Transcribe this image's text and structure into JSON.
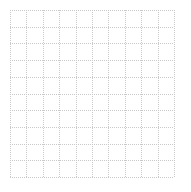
{
  "canvas": {
    "width": 191,
    "height": 192,
    "background_color": "#ffffff"
  },
  "chart_data": {
    "type": "table",
    "title": "",
    "subtitle": "",
    "xlabel": "",
    "ylabel": "",
    "grid": true,
    "legend_position": "none",
    "categories": [],
    "values": [],
    "series": [],
    "tick_labels": {
      "x": [],
      "y": []
    },
    "annotations": [],
    "grid_spec": {
      "columns": 10,
      "rows": 10,
      "vertical_lines": 11,
      "horizontal_lines": 11,
      "cell_width": 16.4,
      "cell_height": 16.7,
      "origin_x": 10,
      "origin_y": 10,
      "plot_width": 164,
      "plot_height": 167,
      "line_style": "dotted",
      "line_color": "#c9c9c9",
      "line_width": 1,
      "dot_period": 2,
      "background_color": "#ffffff"
    }
  }
}
